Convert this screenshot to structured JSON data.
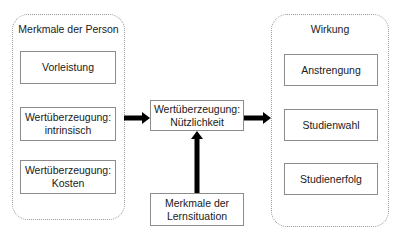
{
  "diagram": {
    "left_group": {
      "title": "Merkmale der Person",
      "items": [
        {
          "label": "Vorleistung"
        },
        {
          "label": "Wertüberzeugung:\nintrinsisch"
        },
        {
          "label": "Wertüberzeugung:\nKosten"
        }
      ]
    },
    "center": {
      "label": "Wertüberzeugung:\nNützlichkeit"
    },
    "bottom": {
      "label": "Merkmale der\nLernsituation"
    },
    "right_group": {
      "title": "Wirkung",
      "items": [
        {
          "label": "Anstrengung"
        },
        {
          "label": "Studienwahl"
        },
        {
          "label": "Studienerfolg"
        }
      ]
    },
    "colors": {
      "arrow": "#000000",
      "box_border": "#8c8c8c",
      "group_border": "#9a9a9a"
    }
  }
}
